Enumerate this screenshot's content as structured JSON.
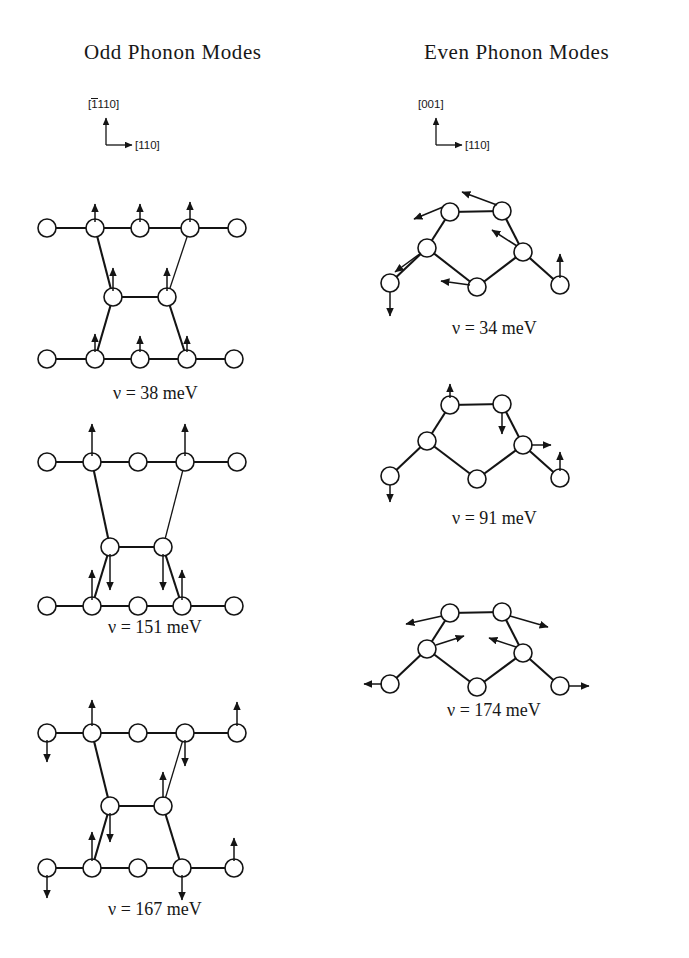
{
  "figure": {
    "columns": [
      {
        "id": "odd",
        "title": "Odd Phonon Modes",
        "axis": {
          "vertical": "110",
          "vertical_overbar": "1",
          "horizontal": "[110]"
        }
      },
      {
        "id": "even",
        "title": "Even Phonon Modes",
        "axis": {
          "vertical": "[001]",
          "horizontal": "[110]"
        }
      }
    ],
    "panels": [
      {
        "id": "odd-1",
        "column": "odd",
        "nu_symbol": "ν",
        "equals": "=",
        "value": "38",
        "unit": "meV",
        "label": "ν = 38 meV",
        "structure": "zigzag-slab"
      },
      {
        "id": "odd-2",
        "column": "odd",
        "nu_symbol": "ν",
        "equals": "=",
        "value": "151",
        "unit": "meV",
        "label": "ν = 151 meV",
        "structure": "zigzag-slab"
      },
      {
        "id": "odd-3",
        "column": "odd",
        "nu_symbol": "ν",
        "equals": "=",
        "value": "167",
        "unit": "meV",
        "label": "ν = 167 meV",
        "structure": "zigzag-slab"
      },
      {
        "id": "even-1",
        "column": "even",
        "nu_symbol": "ν",
        "equals": "=",
        "value": "34",
        "unit": "meV",
        "label": "ν = 34 meV",
        "structure": "hexagon-ring"
      },
      {
        "id": "even-2",
        "column": "even",
        "nu_symbol": "ν",
        "equals": "=",
        "value": "91",
        "unit": "meV",
        "label": "ν = 91 meV",
        "structure": "hexagon-ring"
      },
      {
        "id": "even-3",
        "column": "even",
        "nu_symbol": "ν",
        "equals": "=",
        "value": "174",
        "unit": "meV",
        "label": "ν = 174 meV",
        "structure": "hexagon-ring"
      }
    ],
    "colors": {
      "ink": "#141414",
      "atom_fill": "#ffffff",
      "background": "#ffffff"
    }
  }
}
